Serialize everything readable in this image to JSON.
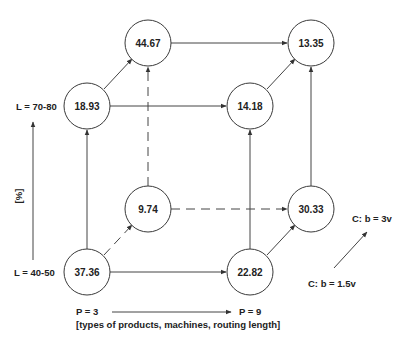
{
  "diagram": {
    "nodes": [
      {
        "id": "n_p3_l70_c3v",
        "value": "44.67"
      },
      {
        "id": "n_p9_l70_c3v",
        "value": "13.35"
      },
      {
        "id": "n_p3_l70_c15v",
        "value": "18.93"
      },
      {
        "id": "n_p9_l70_c15v",
        "value": "14.18"
      },
      {
        "id": "n_p3_l40_c3v",
        "value": "9.74"
      },
      {
        "id": "n_p9_l40_c3v",
        "value": "30.33"
      },
      {
        "id": "n_p3_l40_c15v",
        "value": "37.36"
      },
      {
        "id": "n_p9_l40_c15v",
        "value": "22.82"
      }
    ],
    "axes": {
      "vertical": {
        "top_label": "L = 70-80",
        "bottom_label": "L = 40-50",
        "unit_label": "[%]"
      },
      "horizontal": {
        "left_label": "P = 3",
        "right_label": "P = 9",
        "caption": "[types of products, machines, routing length]"
      },
      "depth": {
        "front_label": "C: b = 1.5v",
        "back_label": "C: b = 3v"
      }
    },
    "colors": {
      "line": "#444444",
      "text": "#222222",
      "background": "#ffffff"
    }
  }
}
